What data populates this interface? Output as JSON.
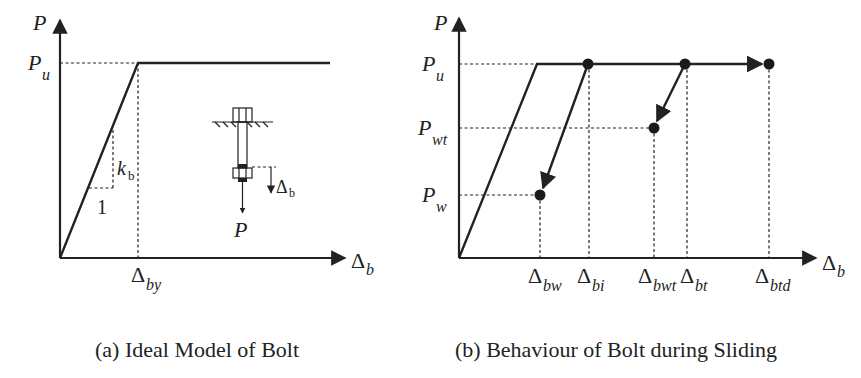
{
  "panel_a": {
    "caption": "(a) Ideal Model of Bolt",
    "y_axis_label": "P",
    "x_axis_label": "b",
    "x_axis_symbol": "Δ",
    "yield_force_label": "P",
    "yield_force_sub": "u",
    "yield_disp_label": "by",
    "stiffness_label": "k",
    "stiffness_sub": "b",
    "slope_run_label": "1",
    "bolt_sketch": {
      "disp_symbol": "Δ",
      "disp_sub": "b",
      "force_label": "P"
    }
  },
  "panel_b": {
    "caption": "(b) Behaviour of Bolt during Sliding",
    "y_axis_label": "P",
    "x_axis_label": "b",
    "x_axis_symbol": "Δ",
    "y_ticks": [
      {
        "label": "P",
        "sub": "u"
      },
      {
        "label": "P",
        "sub": "wt"
      },
      {
        "label": "P",
        "sub": "w"
      }
    ],
    "x_ticks": [
      {
        "sym": "Δ",
        "sub": "bw"
      },
      {
        "sym": "Δ",
        "sub": "bi"
      },
      {
        "sym": "Δ",
        "sub": "bwt"
      },
      {
        "sym": "Δ",
        "sub": "bt"
      },
      {
        "sym": "Δ",
        "sub": "btd"
      }
    ]
  },
  "colors": {
    "ink": "#222222",
    "background": "#ffffff"
  }
}
